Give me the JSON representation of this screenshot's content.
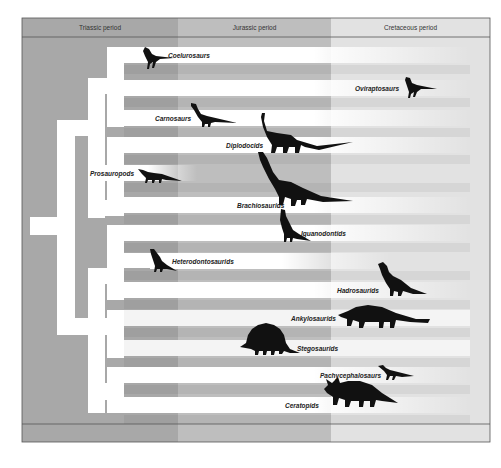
{
  "diagram": {
    "periods": [
      {
        "name": "Triassic period",
        "x0": 22,
        "x1": 178,
        "color": "#a8a8a8"
      },
      {
        "name": "Jurassic period",
        "x0": 178,
        "x1": 331,
        "color": "#bebebe"
      },
      {
        "name": "Cretaceous period",
        "x0": 331,
        "x1": 490,
        "color": "#e2e2e2"
      }
    ],
    "colors": {
      "lineage": "#ffffff",
      "silhouette": "#111111",
      "frame": "#555555",
      "text": "#222222"
    },
    "taxa": [
      {
        "name": "Coelurosaurs",
        "y": 47,
        "x0": 124,
        "x1": 470,
        "label_x": 168,
        "fade": true
      },
      {
        "name": "Oviraptosaurs",
        "y": 80,
        "x0": 124,
        "x1": 470,
        "label_x": 355,
        "fade": true
      },
      {
        "name": "Carnosaurs",
        "y": 110,
        "x0": 124,
        "x1": 470,
        "label_x": 155,
        "fade": true
      },
      {
        "name": "Diplodocids",
        "y": 137,
        "x0": 124,
        "x1": 470,
        "label_x": 226,
        "fade": true
      },
      {
        "name": "Prosauropods",
        "y": 165,
        "x0": 88,
        "x1": 197,
        "label_x": 90,
        "fade": true
      },
      {
        "name": "Brachiosaurids",
        "y": 197,
        "x0": 124,
        "x1": 470,
        "label_x": 237,
        "fade": true
      },
      {
        "name": "Iguanodontids",
        "y": 225,
        "x0": 124,
        "x1": 470,
        "label_x": 301,
        "fade": true
      },
      {
        "name": "Heterodontosaurids",
        "y": 253,
        "x0": 150,
        "x1": 390,
        "label_x": 172,
        "fade": true
      },
      {
        "name": "Hadrosaurids",
        "y": 282,
        "x0": 124,
        "x1": 470,
        "label_x": 337,
        "fade": true
      },
      {
        "name": "Ankylosaurids",
        "y": 310,
        "x0": 124,
        "x1": 470,
        "label_x": 291,
        "fade": false
      },
      {
        "name": "Stegosaurids",
        "y": 340,
        "x0": 124,
        "x1": 470,
        "label_x": 297,
        "fade": false
      },
      {
        "name": "Pachycephalosaurs",
        "y": 367,
        "x0": 124,
        "x1": 470,
        "label_x": 320,
        "fade": true
      },
      {
        "name": "Ceratopids",
        "y": 397,
        "x0": 124,
        "x1": 470,
        "label_x": 285,
        "fade": true
      }
    ]
  }
}
